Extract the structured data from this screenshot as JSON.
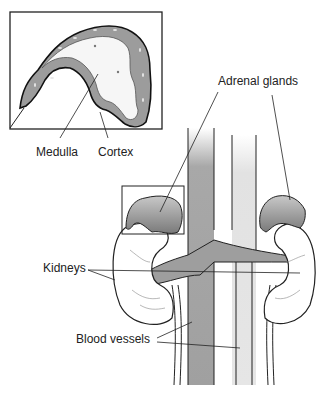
{
  "diagram": {
    "inset": {
      "description": "Magnified cross-section of adrenal gland",
      "labels": [
        "Medulla",
        "Cortex"
      ]
    },
    "labels": {
      "medulla": "Medulla",
      "cortex": "Cortex",
      "adrenal_glands": "Adrenal glands",
      "kidneys": "Kidneys",
      "blood_vessels": "Blood vessels"
    },
    "colors": {
      "tissue_gray": "#9a9a9a",
      "light_gray": "#dcdcdc",
      "outline": "#1a1a1a",
      "background": "#ffffff"
    }
  }
}
